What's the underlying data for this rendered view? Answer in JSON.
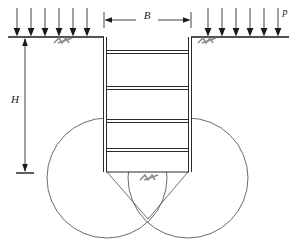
{
  "figure": {
    "type": "engineering-section-diagram"
  },
  "labels": {
    "width_dimension": "B",
    "depth_dimension": "H",
    "surcharge_load": "p"
  },
  "colors": {
    "line": "#2b2b2b",
    "circle": "#5a5a5a",
    "hatch": "#8a8a8a",
    "background": "#ffffff",
    "text": "#1a1a1a"
  },
  "geometry": {
    "ground_line_y": 37,
    "ground_left_start_x": 8,
    "ground_left_end_x": 104,
    "ground_right_start_x": 191,
    "ground_right_end_x": 289,
    "wall_left_outer_x": 103,
    "wall_left_inner_x": 107,
    "wall_right_inner_x": 188,
    "wall_right_outer_x": 192,
    "wall_bottom_y": 172,
    "excavation_width_px": 85,
    "excavation_depth_px": 135
  },
  "surcharge_arrows": {
    "count_left": 6,
    "count_right": 6,
    "arrow_top_y": 8,
    "arrow_tip_y": 36,
    "left_x_positions": [
      17,
      31,
      45,
      59,
      73,
      87
    ],
    "right_x_positions": [
      208,
      222,
      236,
      250,
      264,
      278
    ],
    "label_text": "p",
    "label_x": 285,
    "label_y": 14
  },
  "width_dimension_line": {
    "label": "B",
    "y": 20,
    "x_start": 104,
    "x_end": 191,
    "label_x": 147,
    "label_y": 15
  },
  "depth_dimension_line": {
    "label": "H",
    "x": 25,
    "y_start": 38,
    "y_end": 172,
    "label_x": 15,
    "label_y": 100,
    "base_tick_half_width": 9
  },
  "struts": {
    "count": 4,
    "thickness_px": 3,
    "y_positions": [
      52,
      88,
      121,
      150
    ],
    "x_start": 107,
    "x_end": 188
  },
  "slip_circles": [
    {
      "name": "left-slip-circle",
      "cx": 107,
      "cy": 178,
      "r": 60
    },
    {
      "name": "right-slip-circle",
      "cx": 188,
      "cy": 178,
      "r": 60
    }
  ],
  "failure_wedge": {
    "apex_x": 147,
    "apex_y": 219,
    "left_corner_x": 107,
    "left_corner_y": 172,
    "right_corner_x": 188,
    "right_corner_y": 172
  },
  "ground_symbols": [
    {
      "name": "ground-hatch-left",
      "x": 62,
      "y": 38
    },
    {
      "name": "ground-hatch-right",
      "x": 206,
      "y": 38
    },
    {
      "name": "excavation-base-hatch",
      "x": 148,
      "y": 175
    }
  ]
}
